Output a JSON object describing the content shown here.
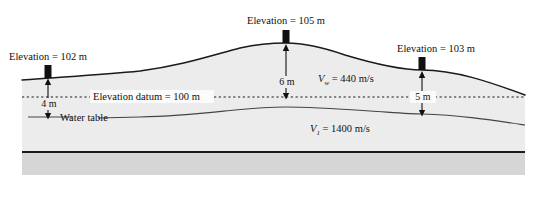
{
  "figure": {
    "type": "geologic-cross-section",
    "title_visible": false,
    "surface_markers": [
      {
        "id": "left",
        "label": "Elevation = 102 m",
        "elevation_m": 102,
        "x": 48,
        "surface_y": 78
      },
      {
        "id": "crest",
        "label": "Elevation = 105 m",
        "elevation_m": 105,
        "x": 286,
        "surface_y": 43
      },
      {
        "id": "right",
        "label": "Elevation = 103 m",
        "elevation_m": 103,
        "x": 422,
        "surface_y": 70
      }
    ],
    "datum": {
      "label": "Elevation datum = 100 m",
      "elevation_m": 100,
      "y": 97,
      "style": "dotted"
    },
    "water_table": {
      "label": "Water table"
    },
    "depth_dimensions": [
      {
        "id": "left-depth",
        "label": "4 m",
        "value_m": 4,
        "x": 48,
        "from_y": 78,
        "to_y": 117
      },
      {
        "id": "crest-depth",
        "label": "6 m",
        "value_m": 6,
        "x": 286,
        "from_y": 43,
        "to_y": 97
      },
      {
        "id": "right-depth",
        "label": "5 m",
        "value_m": 5,
        "x": 422,
        "from_y": 70,
        "to_y": 114
      }
    ],
    "velocities": [
      {
        "id": "weathering-layer",
        "symbol": "V",
        "subscript": "w",
        "text": "= 440 m/s",
        "value_ms": 440,
        "x": 345,
        "y": 79
      },
      {
        "id": "layer-1",
        "symbol": "V",
        "subscript": "1",
        "text": "= 1400 m/s",
        "value_ms": 1400,
        "x": 337,
        "y": 129
      }
    ],
    "colors": {
      "background": "#ffffff",
      "subsurface_fill": "#ececec",
      "bedrock_fill": "#d6d6d6",
      "line": "#1a1a1a",
      "water_table_line": "#555555",
      "text": "#111111"
    },
    "bounds": {
      "left": 22,
      "right": 525,
      "top": 14,
      "bottom": 175
    }
  }
}
